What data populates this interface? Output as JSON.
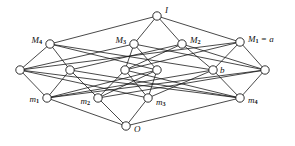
{
  "figure": {
    "kind": "hasse-diagram",
    "background_color": "#ffffff",
    "line_color": "#1a1a1a",
    "node_fill": "#ffffff",
    "width": 295,
    "height": 146
  },
  "chart_data": {
    "type": "diagram",
    "diagram_type": "hasse-lattice",
    "title": "",
    "xlabel": "",
    "ylabel": "",
    "levels": [
      {
        "rank": 4,
        "name": "top",
        "node_ids": [
          "I"
        ]
      },
      {
        "rank": 3,
        "name": "coatoms",
        "node_ids": [
          "M4",
          "M3",
          "M2",
          "M1"
        ]
      },
      {
        "rank": 2,
        "name": "middle",
        "node_ids": [
          "c1",
          "c2",
          "c3",
          "c4",
          "b",
          "c6"
        ]
      },
      {
        "rank": 1,
        "name": "atoms",
        "node_ids": [
          "m1",
          "m2",
          "m3",
          "m4"
        ]
      },
      {
        "rank": 0,
        "name": "bottom",
        "node_ids": [
          "O"
        ]
      }
    ],
    "nodes": [
      {
        "id": "I",
        "x": 157,
        "y": 16,
        "label": "I",
        "sub": "",
        "suffix": "",
        "label_dx": 8,
        "label_dy": -5,
        "anchor": "start"
      },
      {
        "id": "M4",
        "x": 50,
        "y": 44,
        "label": "M",
        "sub": "4",
        "suffix": "",
        "label_dx": -8,
        "label_dy": -3,
        "anchor": "end"
      },
      {
        "id": "M3",
        "x": 134,
        "y": 44,
        "label": "M",
        "sub": "3",
        "suffix": "",
        "label_dx": -8,
        "label_dy": -3,
        "anchor": "end"
      },
      {
        "id": "M2",
        "x": 182,
        "y": 44,
        "label": "M",
        "sub": "2",
        "suffix": "",
        "label_dx": 8,
        "label_dy": -3,
        "anchor": "start"
      },
      {
        "id": "M1",
        "x": 240,
        "y": 42,
        "label": "M",
        "sub": "1",
        "suffix": " = a",
        "label_dx": 8,
        "label_dy": -2,
        "anchor": "start"
      },
      {
        "id": "c1",
        "x": 20,
        "y": 70,
        "label": "",
        "sub": "",
        "suffix": "",
        "label_dx": 0,
        "label_dy": 0,
        "anchor": "start"
      },
      {
        "id": "c2",
        "x": 70,
        "y": 70,
        "label": "",
        "sub": "",
        "suffix": "",
        "label_dx": 0,
        "label_dy": 0,
        "anchor": "start"
      },
      {
        "id": "c3",
        "x": 125,
        "y": 70,
        "label": "",
        "sub": "",
        "suffix": "",
        "label_dx": 0,
        "label_dy": 0,
        "anchor": "start"
      },
      {
        "id": "c4",
        "x": 157,
        "y": 70,
        "label": "",
        "sub": "",
        "suffix": "",
        "label_dx": 0,
        "label_dy": 0,
        "anchor": "start"
      },
      {
        "id": "b",
        "x": 213,
        "y": 70,
        "label": "b",
        "sub": "",
        "suffix": "",
        "label_dx": 7,
        "label_dy": 1,
        "anchor": "start"
      },
      {
        "id": "c6",
        "x": 265,
        "y": 70,
        "label": "",
        "sub": "",
        "suffix": "",
        "label_dx": 0,
        "label_dy": 0,
        "anchor": "start"
      },
      {
        "id": "m1",
        "x": 47,
        "y": 98,
        "label": "m",
        "sub": "1",
        "suffix": "",
        "label_dx": -8,
        "label_dy": 2,
        "anchor": "end"
      },
      {
        "id": "m2",
        "x": 98,
        "y": 98,
        "label": "m",
        "sub": "2",
        "suffix": "",
        "label_dx": -8,
        "label_dy": 4,
        "anchor": "end"
      },
      {
        "id": "m3",
        "x": 148,
        "y": 98,
        "label": "m",
        "sub": "3",
        "suffix": "",
        "label_dx": 8,
        "label_dy": 5,
        "anchor": "start"
      },
      {
        "id": "m4",
        "x": 240,
        "y": 98,
        "label": "m",
        "sub": "4",
        "suffix": "",
        "label_dx": 8,
        "label_dy": 3,
        "anchor": "start"
      },
      {
        "id": "O",
        "x": 126,
        "y": 126,
        "label": "O",
        "sub": "",
        "suffix": "",
        "label_dx": 8,
        "label_dy": 4,
        "anchor": "start"
      }
    ],
    "edges": [
      {
        "from": "I",
        "to": "M4"
      },
      {
        "from": "I",
        "to": "M3"
      },
      {
        "from": "I",
        "to": "M2"
      },
      {
        "from": "I",
        "to": "M1"
      },
      {
        "from": "M4",
        "to": "c1"
      },
      {
        "from": "M4",
        "to": "c2"
      },
      {
        "from": "M4",
        "to": "c4"
      },
      {
        "from": "M4",
        "to": "b"
      },
      {
        "from": "M3",
        "to": "c1"
      },
      {
        "from": "M3",
        "to": "c3"
      },
      {
        "from": "M3",
        "to": "c4"
      },
      {
        "from": "M3",
        "to": "c6"
      },
      {
        "from": "M2",
        "to": "c2"
      },
      {
        "from": "M2",
        "to": "c3"
      },
      {
        "from": "M2",
        "to": "b"
      },
      {
        "from": "M2",
        "to": "c6"
      },
      {
        "from": "M1",
        "to": "c1"
      },
      {
        "from": "M1",
        "to": "c3"
      },
      {
        "from": "M1",
        "to": "b"
      },
      {
        "from": "M1",
        "to": "c6"
      },
      {
        "from": "c1",
        "to": "m1"
      },
      {
        "from": "c1",
        "to": "m3"
      },
      {
        "from": "c1",
        "to": "m4"
      },
      {
        "from": "c2",
        "to": "m1"
      },
      {
        "from": "c2",
        "to": "m2"
      },
      {
        "from": "c2",
        "to": "m4"
      },
      {
        "from": "c3",
        "to": "m2"
      },
      {
        "from": "c3",
        "to": "m3"
      },
      {
        "from": "c3",
        "to": "m4"
      },
      {
        "from": "c4",
        "to": "m1"
      },
      {
        "from": "c4",
        "to": "m2"
      },
      {
        "from": "c4",
        "to": "m3"
      },
      {
        "from": "b",
        "to": "m1"
      },
      {
        "from": "b",
        "to": "m3"
      },
      {
        "from": "b",
        "to": "m4"
      },
      {
        "from": "c6",
        "to": "m1"
      },
      {
        "from": "c6",
        "to": "m2"
      },
      {
        "from": "c6",
        "to": "m4"
      },
      {
        "from": "m1",
        "to": "O"
      },
      {
        "from": "m2",
        "to": "O"
      },
      {
        "from": "m3",
        "to": "O"
      },
      {
        "from": "m4",
        "to": "O"
      }
    ],
    "labels_visible": [
      "I",
      "M4",
      "M3",
      "M2",
      "M1 = a",
      "b",
      "m1",
      "m2",
      "m3",
      "m4",
      "O"
    ],
    "node_radius": 4.2
  }
}
